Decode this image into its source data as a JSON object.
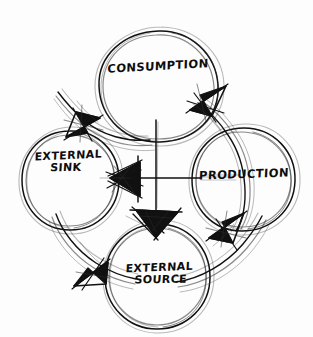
{
  "diagram": {
    "style": "hand-drawn pen sketch, black ink on white paper",
    "background_color": "#fdfdfd",
    "ink_color": "#111111",
    "nodes": [
      {
        "id": "consumption",
        "label_lines": [
          "CONSUMPTION"
        ],
        "position": "top",
        "shape": "circle",
        "center": {
          "x": 158,
          "y": 86
        },
        "radius": 56
      },
      {
        "id": "production",
        "label_lines": [
          "PRODUCTION"
        ],
        "position": "right",
        "shape": "circle",
        "center": {
          "x": 243,
          "y": 180
        },
        "radius": 52
      },
      {
        "id": "external-source",
        "label_lines": [
          "EXTERNAL",
          "SOURCE"
        ],
        "position": "bottom",
        "shape": "circle",
        "center": {
          "x": 158,
          "y": 277
        },
        "radius": 53
      },
      {
        "id": "external-sink",
        "label_lines": [
          "EXTERNAL",
          "SINK"
        ],
        "position": "left",
        "shape": "circle",
        "center": {
          "x": 70,
          "y": 180
        },
        "radius": 50
      }
    ],
    "connections": [
      {
        "id": "arc-consumption-to-sink",
        "from": "consumption",
        "to": "external-sink",
        "kind": "curved-arc",
        "arrow_at": "external-sink"
      },
      {
        "id": "arc-sink-to-source",
        "from": "external-sink",
        "to": "external-source",
        "kind": "curved-arc",
        "arrow_at": "external-source"
      },
      {
        "id": "arc-source-to-production",
        "from": "external-source",
        "to": "production",
        "kind": "curved-arc",
        "arrow_at": "production"
      },
      {
        "id": "arc-production-to-consumption",
        "from": "production",
        "to": "consumption",
        "kind": "curved-arc",
        "arrow_at": "consumption"
      },
      {
        "id": "center-arrow-to-sink",
        "from": "center",
        "to": "external-sink",
        "kind": "straight",
        "arrow_at": "external-sink"
      },
      {
        "id": "center-arrow-to-source",
        "from": "center",
        "to": "external-source",
        "kind": "straight",
        "arrow_at": "external-source"
      },
      {
        "id": "center-axis-vertical",
        "from": "consumption",
        "to": "center",
        "kind": "straight",
        "arrow_at": "none"
      },
      {
        "id": "center-axis-horizontal",
        "from": "production",
        "to": "center",
        "kind": "straight",
        "arrow_at": "none"
      }
    ],
    "center_point": {
      "x": 156,
      "y": 179
    }
  }
}
